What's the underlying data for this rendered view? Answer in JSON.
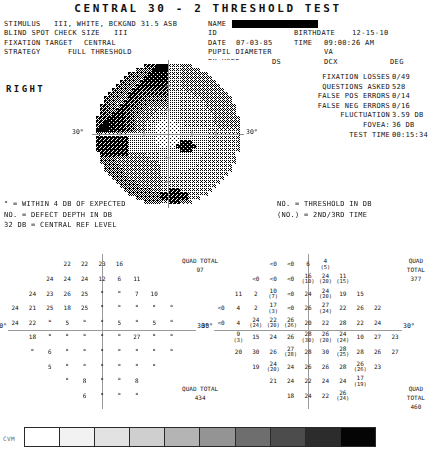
{
  "title": "CENTRAL  30 - 2  THRESHOLD  TEST",
  "header": {
    "row1": {
      "stimulus_label": "STIMULUS",
      "stimulus_value": "III, WHITE, BCKGND 31.5 ASB",
      "name_label": "NAME",
      "name_value": ""
    },
    "row2": {
      "blind_spot_label": "BLIND SPOT CHECK SIZE",
      "blind_spot_value": "III",
      "id_label": "ID",
      "id_value": "",
      "birthdate_label": "BIRTHDATE",
      "birthdate_value": "12-15-10"
    },
    "row3": {
      "fixation_label": "FIXATION TARGET",
      "fixation_value": "CENTRAL",
      "date_label": "DATE",
      "date_value": "07-03-85",
      "time_label": "TIME",
      "time_value": "09:00:26 AM"
    },
    "row4": {
      "strategy_label": "STRATEGY",
      "strategy_value": "FULL THRESHOLD",
      "pupil_label": "PUPIL DIAMETER",
      "pupil_value": "",
      "va_label": "VA",
      "va_value": ""
    },
    "row5": {
      "rx_label": "RX USED",
      "ds_label": "DS",
      "dcx_label": "DCX",
      "deg_label": "DEG"
    }
  },
  "eye_label": "RIGHT",
  "stats": [
    {
      "label": "FIXATION LOSSES",
      "value": "0/49"
    },
    {
      "label": "QUESTIONS ASKED",
      "value": "528"
    },
    {
      "label": "FALSE POS ERRORS",
      "value": "0/14"
    },
    {
      "label": "FALSE NEG ERRORS",
      "value": "0/16"
    },
    {
      "label": "FLUCTUATION",
      "value": "3.59 DB"
    },
    {
      "label": "FOVEA:",
      "value": "36 DB"
    },
    {
      "label": "TEST TIME",
      "value": "00:15:34"
    }
  ],
  "map": {
    "degree_left": "30°",
    "degree_right": "30°"
  },
  "legend_left": [
    "° = WITHIN 4 DB OF EXPECTED",
    "NO. = DEFECT DEPTH IN DB",
    "32 DB     = CENTRAL REF LEVEL"
  ],
  "legend_right": [
    "NO.  = THRESHOLD IN DB",
    "(NO.) = 2ND/3RD TIME"
  ],
  "plot_left": {
    "degree_left": "30°",
    "degree_right": "30°",
    "rows": [
      {
        "y": 0,
        "cells": [
          {
            "x": 3,
            "t": "22"
          },
          {
            "x": 4,
            "t": "22"
          },
          {
            "x": 5,
            "t": "23"
          },
          {
            "x": 6,
            "t": "16"
          }
        ]
      },
      {
        "y": 1,
        "cells": [
          {
            "x": 2,
            "t": "24"
          },
          {
            "x": 3,
            "t": "24"
          },
          {
            "x": 4,
            "t": "24"
          },
          {
            "x": 5,
            "t": "12"
          },
          {
            "x": 6,
            "t": "6"
          },
          {
            "x": 7,
            "t": "11"
          }
        ]
      },
      {
        "y": 2,
        "cells": [
          {
            "x": 1,
            "t": "24"
          },
          {
            "x": 2,
            "t": "23"
          },
          {
            "x": 3,
            "t": "26"
          },
          {
            "x": 4,
            "t": "25"
          },
          {
            "x": 5,
            "t": "°"
          },
          {
            "x": 6,
            "t": "°"
          },
          {
            "x": 7,
            "t": "7"
          },
          {
            "x": 8,
            "t": "10"
          }
        ]
      },
      {
        "y": 3,
        "cells": [
          {
            "x": 0,
            "t": "24"
          },
          {
            "x": 1,
            "t": "21"
          },
          {
            "x": 2,
            "t": "25"
          },
          {
            "x": 3,
            "t": "18"
          },
          {
            "x": 4,
            "t": "25"
          },
          {
            "x": 5,
            "t": "°"
          },
          {
            "x": 6,
            "t": "°"
          },
          {
            "x": 7,
            "t": "°"
          },
          {
            "x": 8,
            "t": "°"
          },
          {
            "x": 9,
            "t": "°"
          }
        ]
      },
      {
        "y": 4,
        "cells": [
          {
            "x": 0,
            "t": "24"
          },
          {
            "x": 1,
            "t": "22"
          },
          {
            "x": 2,
            "t": "°"
          },
          {
            "x": 3,
            "t": "5"
          },
          {
            "x": 4,
            "t": "°"
          },
          {
            "x": 5,
            "t": "°"
          },
          {
            "x": 6,
            "t": "5"
          },
          {
            "x": 7,
            "t": "°"
          },
          {
            "x": 8,
            "t": "5"
          },
          {
            "x": 9,
            "t": "°"
          }
        ]
      },
      {
        "y": 5,
        "cells": [
          {
            "x": 1,
            "t": "18"
          },
          {
            "x": 2,
            "t": "°"
          },
          {
            "x": 3,
            "t": "°"
          },
          {
            "x": 4,
            "t": "°"
          },
          {
            "x": 5,
            "t": "°"
          },
          {
            "x": 6,
            "t": "°"
          },
          {
            "x": 7,
            "t": "27"
          },
          {
            "x": 8,
            "t": "°"
          },
          {
            "x": 9,
            "t": "°"
          }
        ]
      },
      {
        "y": 6,
        "cells": [
          {
            "x": 1,
            "t": "°"
          },
          {
            "x": 2,
            "t": "6"
          },
          {
            "x": 3,
            "t": "°"
          },
          {
            "x": 4,
            "t": "°"
          },
          {
            "x": 5,
            "t": "°"
          },
          {
            "x": 6,
            "t": "°"
          },
          {
            "x": 7,
            "t": "°"
          },
          {
            "x": 8,
            "t": "°"
          },
          {
            "x": 9,
            "t": "°"
          }
        ]
      },
      {
        "y": 7,
        "cells": [
          {
            "x": 2,
            "t": "5"
          },
          {
            "x": 3,
            "t": "°"
          },
          {
            "x": 4,
            "t": "°"
          },
          {
            "x": 5,
            "t": "°"
          },
          {
            "x": 6,
            "t": "°"
          },
          {
            "x": 7,
            "t": "°"
          },
          {
            "x": 8,
            "t": "°"
          }
        ]
      },
      {
        "y": 8,
        "cells": [
          {
            "x": 3,
            "t": "°"
          },
          {
            "x": 4,
            "t": "8"
          },
          {
            "x": 5,
            "t": "°"
          },
          {
            "x": 6,
            "t": "°"
          },
          {
            "x": 7,
            "t": "8"
          }
        ]
      },
      {
        "y": 9,
        "cells": [
          {
            "x": 4,
            "t": "6"
          },
          {
            "x": 5,
            "t": "°"
          },
          {
            "x": 6,
            "t": "°"
          },
          {
            "x": 7,
            "t": "°"
          }
        ]
      }
    ]
  },
  "plot_right": {
    "degree_left": "30°",
    "degree_right": "30°",
    "quad_totals": [
      {
        "label": "QUAD TOTAL",
        "value": "97",
        "pos": "top-left"
      },
      {
        "label": "QUAD TOTAL",
        "value": "377",
        "pos": "top-right"
      },
      {
        "label": "QUAD TOTAL",
        "value": "434",
        "pos": "bottom-left"
      },
      {
        "label": "QUAD TOTAL",
        "value": "460",
        "pos": "bottom-right"
      }
    ],
    "rows": [
      {
        "y": 0,
        "cells": [
          {
            "x": 3,
            "t": "<0"
          },
          {
            "x": 4,
            "t": "<0"
          },
          {
            "x": 5,
            "t": "6"
          },
          {
            "x": 6,
            "t": "4",
            "sub": "(5)"
          }
        ]
      },
      {
        "y": 1,
        "cells": [
          {
            "x": 2,
            "t": "<0"
          },
          {
            "x": 3,
            "t": "<0"
          },
          {
            "x": 4,
            "t": "<0"
          },
          {
            "x": 5,
            "t": "16",
            "sub": "(10)"
          },
          {
            "x": 6,
            "t": "24",
            "sub": "(20)"
          },
          {
            "x": 7,
            "t": "11",
            "sub": "(15)"
          }
        ]
      },
      {
        "y": 2,
        "cells": [
          {
            "x": 1,
            "t": "11"
          },
          {
            "x": 2,
            "t": "2"
          },
          {
            "x": 3,
            "t": "10",
            "sub": "(7)"
          },
          {
            "x": 4,
            "t": "<0"
          },
          {
            "x": 5,
            "t": "24"
          },
          {
            "x": 6,
            "t": "24",
            "sub": "(20)"
          },
          {
            "x": 7,
            "t": "19"
          },
          {
            "x": 8,
            "t": "15"
          }
        ]
      },
      {
        "y": 3,
        "cells": [
          {
            "x": 0,
            "t": "<0"
          },
          {
            "x": 1,
            "t": "4"
          },
          {
            "x": 2,
            "t": "2"
          },
          {
            "x": 3,
            "t": "17",
            "sub": "(3)"
          },
          {
            "x": 4,
            "t": "<0"
          },
          {
            "x": 5,
            "t": "26"
          },
          {
            "x": 6,
            "t": "27",
            "sub": "(24)"
          },
          {
            "x": 7,
            "t": "22"
          },
          {
            "x": 8,
            "t": "26"
          },
          {
            "x": 9,
            "t": "22"
          }
        ]
      },
      {
        "y": 4,
        "cells": [
          {
            "x": 0,
            "t": "<0"
          },
          {
            "x": 1,
            "t": "4"
          },
          {
            "x": 2,
            "t": "24",
            "sub": "(24)"
          },
          {
            "x": 3,
            "t": "22",
            "sub": "(20)"
          },
          {
            "x": 4,
            "t": "26",
            "sub": "(26)"
          },
          {
            "x": 5,
            "t": "20"
          },
          {
            "x": 6,
            "t": "22"
          },
          {
            "x": 7,
            "t": "28"
          },
          {
            "x": 8,
            "t": "22"
          },
          {
            "x": 9,
            "t": "24"
          }
        ]
      },
      {
        "y": 5,
        "cells": [
          {
            "x": 1,
            "t": "9",
            "sub": "(3)"
          },
          {
            "x": 2,
            "t": "15"
          },
          {
            "x": 3,
            "t": "24"
          },
          {
            "x": 4,
            "t": "26"
          },
          {
            "x": 5,
            "t": "28",
            "sub": "(30)"
          },
          {
            "x": 6,
            "t": "26",
            "sub": "(20)"
          },
          {
            "x": 7,
            "t": "24",
            "sub": "(24)"
          },
          {
            "x": 8,
            "t": "10"
          },
          {
            "x": 9,
            "t": "27"
          },
          {
            "x": 10,
            "t": "23"
          }
        ]
      },
      {
        "y": 6,
        "cells": [
          {
            "x": 1,
            "t": "20"
          },
          {
            "x": 2,
            "t": "30"
          },
          {
            "x": 3,
            "t": "26"
          },
          {
            "x": 4,
            "t": "27",
            "sub": "(28)"
          },
          {
            "x": 5,
            "t": "28"
          },
          {
            "x": 6,
            "t": "30"
          },
          {
            "x": 7,
            "t": "28",
            "sub": "(25)"
          },
          {
            "x": 8,
            "t": "28"
          },
          {
            "x": 9,
            "t": "26"
          },
          {
            "x": 10,
            "t": "27"
          }
        ]
      },
      {
        "y": 7,
        "cells": [
          {
            "x": 2,
            "t": "19"
          },
          {
            "x": 3,
            "t": "24",
            "sub": "(20)"
          },
          {
            "x": 4,
            "t": "24"
          },
          {
            "x": 5,
            "t": "26"
          },
          {
            "x": 6,
            "t": "26"
          },
          {
            "x": 7,
            "t": "28"
          },
          {
            "x": 8,
            "t": "26",
            "sub": "(26)"
          },
          {
            "x": 9,
            "t": "23"
          }
        ]
      },
      {
        "y": 8,
        "cells": [
          {
            "x": 3,
            "t": "21"
          },
          {
            "x": 4,
            "t": "24"
          },
          {
            "x": 5,
            "t": "22"
          },
          {
            "x": 6,
            "t": "24"
          },
          {
            "x": 7,
            "t": "24"
          },
          {
            "x": 8,
            "t": "17",
            "sub": "(19)"
          }
        ]
      },
      {
        "y": 9,
        "cells": [
          {
            "x": 4,
            "t": "18"
          },
          {
            "x": 5,
            "t": "24"
          },
          {
            "x": 6,
            "t": "22"
          },
          {
            "x": 7,
            "t": "26",
            "sub": "(24)"
          }
        ]
      }
    ]
  },
  "scale": {
    "label": "CVM",
    "steps": [
      "#ffffff",
      "#f2f2f2",
      "#e2e2e2",
      "#cfcfcf",
      "#b4b4b4",
      "#949494",
      "#6e6e6e",
      "#4c4c4c",
      "#2c2c2c",
      "#050505"
    ]
  }
}
